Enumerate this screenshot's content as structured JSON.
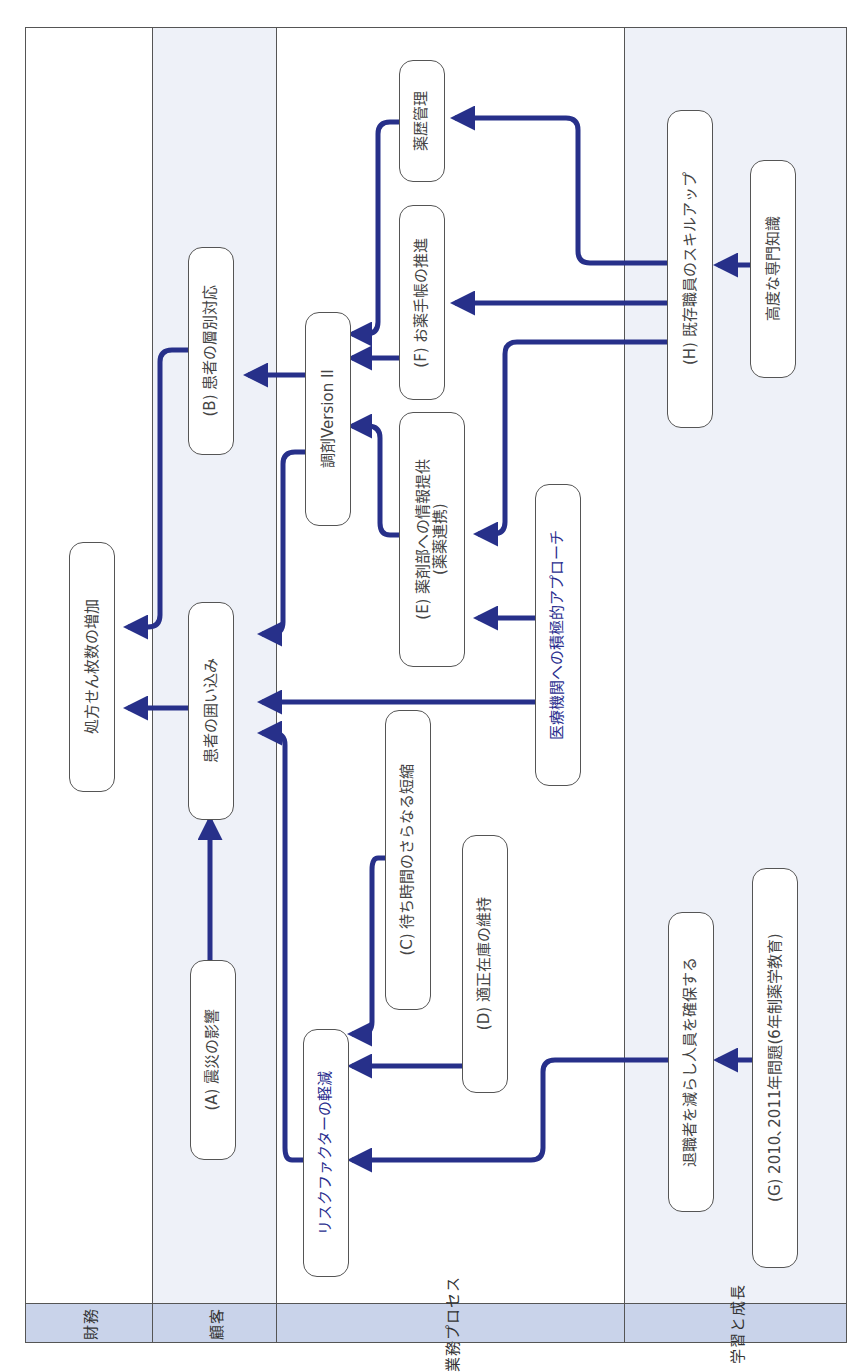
{
  "lanes": [
    {
      "id": "finance",
      "label": "財務",
      "color": "#ffffff"
    },
    {
      "id": "customer",
      "label": "顧客",
      "color": "#eef1f8"
    },
    {
      "id": "process",
      "label": "業務プロセス",
      "color": "#ffffff"
    },
    {
      "id": "learning",
      "label": "学習と成長",
      "color": "#eef1f8"
    }
  ],
  "header_color": "#c9d3ea",
  "arrow_color": "#27308a",
  "nodes": {
    "prescriptions": "処方せん枚数の増加",
    "retention": "患者の囲い込み",
    "segment": "(B) 患者の層別対応",
    "disaster": "(A) 震災の影響",
    "dispensing": "調剤Version II",
    "history": "薬歴管理",
    "notebook": "(F) お薬手帳の推進",
    "info_line1": "(E) 薬剤部への情報提供",
    "info_line2": "(薬薬連携)",
    "approach": "医療機関への積極的アプローチ",
    "wait": "(C) 待ち時間のさらなる短縮",
    "inventory": "(D) 適正在庫の維持",
    "risk": "リスクファクターの軽減",
    "skillup": "(H) 既存職員のスキルアップ",
    "expertise": "高度な専門知識",
    "retain": "退職者を減らし人員を確保する",
    "problem": "(G) 2010､2011年問題(6年制薬学教育)"
  }
}
